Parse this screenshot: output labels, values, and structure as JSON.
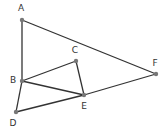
{
  "diagram": {
    "type": "geometry",
    "line_color": "#333333",
    "point_color": "#777777",
    "points": [
      {
        "id": "A",
        "label": "A",
        "x": 22,
        "y": 20,
        "lx": 21,
        "ly": 11
      },
      {
        "id": "B",
        "label": "B",
        "x": 22,
        "y": 81,
        "lx": 13,
        "ly": 83
      },
      {
        "id": "C",
        "label": "C",
        "x": 76,
        "y": 61,
        "lx": 75,
        "ly": 53
      },
      {
        "id": "D",
        "label": "D",
        "x": 16,
        "y": 112,
        "lx": 13,
        "ly": 126
      },
      {
        "id": "E",
        "label": "E",
        "x": 84,
        "y": 95,
        "lx": 84,
        "ly": 109
      },
      {
        "id": "F",
        "label": "F",
        "x": 156,
        "y": 74,
        "lx": 155,
        "ly": 66
      }
    ],
    "segments": [
      [
        "A",
        "B"
      ],
      [
        "A",
        "F"
      ],
      [
        "B",
        "C"
      ],
      [
        "C",
        "E"
      ],
      [
        "B",
        "E"
      ],
      [
        "B",
        "D"
      ],
      [
        "D",
        "E"
      ],
      [
        "E",
        "F"
      ]
    ]
  }
}
